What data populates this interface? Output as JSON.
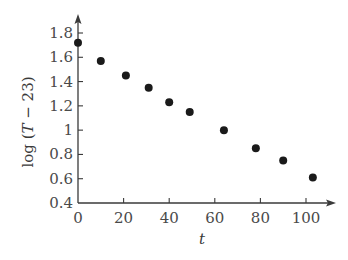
{
  "chart_data": {
    "type": "scatter",
    "title": "",
    "xlabel": "t",
    "ylabel": "log (T − 23)",
    "ylabel_parts": {
      "prefix": "log (",
      "var": "T",
      "suffix": " − 23)"
    },
    "xlim": [
      0,
      110
    ],
    "ylim": [
      0.4,
      1.9
    ],
    "x_ticks": [
      0,
      20,
      40,
      60,
      80,
      100
    ],
    "x_tick_labels": [
      "0",
      "20",
      "40",
      "60",
      "80",
      "100"
    ],
    "y_ticks": [
      0.4,
      0.6,
      0.8,
      1.0,
      1.2,
      1.4,
      1.6,
      1.8
    ],
    "y_tick_labels": [
      "0.4",
      "0.6",
      "0.8",
      "1",
      "1.2",
      "1.4",
      "1.6",
      "1.8"
    ],
    "grid": false,
    "legend": null,
    "series": [
      {
        "name": "data",
        "marker": "filled-circle",
        "color": "#1a1a1a",
        "x": [
          0,
          10,
          21,
          31,
          40,
          49,
          64,
          78,
          90,
          103
        ],
        "y": [
          1.72,
          1.57,
          1.45,
          1.35,
          1.23,
          1.15,
          1.0,
          0.85,
          0.75,
          0.61
        ]
      }
    ]
  },
  "style": {
    "axis_color": "#3a3a3a",
    "marker_color": "#1a1a1a",
    "background": "#ffffff"
  }
}
